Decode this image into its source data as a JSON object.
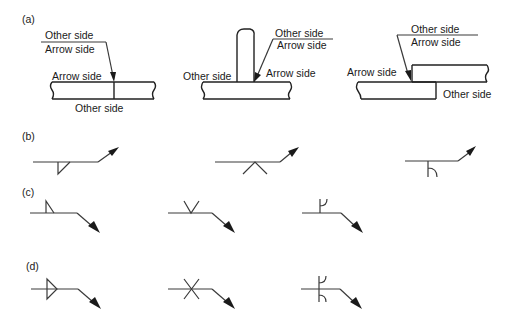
{
  "figure": {
    "panels": [
      {
        "label": "(a)",
        "joints": [
          {
            "type": "butt-joint",
            "texts": {
              "ref_top": "Other side",
              "ref_bottom": "Arrow side",
              "arrow_side": "Arrow side",
              "other_side": "Other side"
            }
          },
          {
            "type": "tee-joint",
            "texts": {
              "ref_top": "Other side",
              "ref_bottom": "Arrow side",
              "arrow_side": "Arrow side",
              "other_side": "Other side"
            }
          },
          {
            "type": "lap-joint",
            "texts": {
              "ref_top": "Other side",
              "ref_bottom": "Arrow side",
              "arrow_side": "Arrow side",
              "other_side": "Other side"
            }
          }
        ]
      },
      {
        "label": "(b)",
        "symbols": [
          "fillet-arrow-side",
          "v-groove-arrow-side",
          "j-groove-arrow-side"
        ]
      },
      {
        "label": "(c)",
        "symbols": [
          "fillet-other-side",
          "v-groove-other-side",
          "j-groove-other-side"
        ]
      },
      {
        "label": "(d)",
        "symbols": [
          "fillet-both-sides",
          "v-groove-both-sides",
          "j-groove-both-sides"
        ]
      }
    ]
  }
}
